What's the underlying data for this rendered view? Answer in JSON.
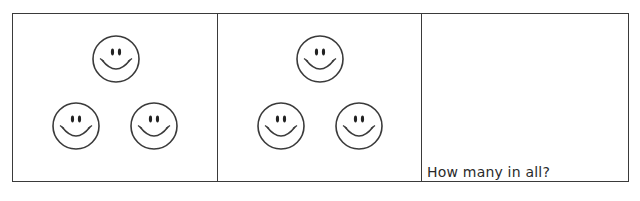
{
  "worksheet": {
    "groups": [
      {
        "id": "group-1",
        "count": 3,
        "item_icon": "smiley-face-icon",
        "faces": [
          {
            "x": 78,
            "y": 20
          },
          {
            "x": 38,
            "y": 87
          },
          {
            "x": 116,
            "y": 87
          }
        ]
      },
      {
        "id": "group-2",
        "count": 3,
        "item_icon": "smiley-face-icon",
        "faces": [
          {
            "x": 77,
            "y": 20
          },
          {
            "x": 38,
            "y": 87
          },
          {
            "x": 116,
            "y": 87
          }
        ]
      }
    ],
    "answer_box": {
      "prompt": "How many in all?",
      "answer": ""
    },
    "colors": {
      "line": "#3a3a3a",
      "text": "#2a2a2a",
      "background": "#ffffff"
    }
  }
}
